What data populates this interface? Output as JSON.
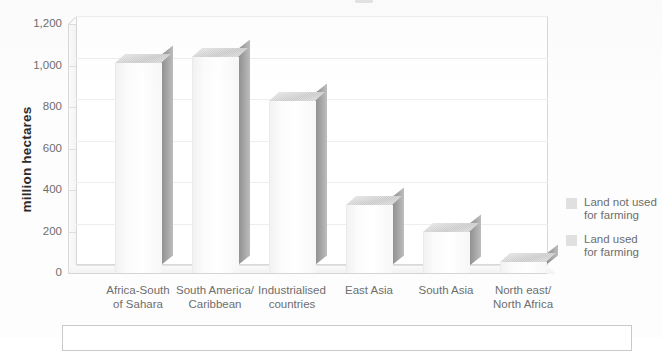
{
  "chart_data": {
    "type": "bar",
    "title": "",
    "xlabel": "",
    "ylabel": "million hectares",
    "ylim": [
      0,
      1200
    ],
    "yticks": [
      "0",
      "200",
      "400",
      "600",
      "800",
      "1,000",
      "1,200"
    ],
    "grid": true,
    "legend_position": "right",
    "categories": [
      "Africa-South\nof Sahara",
      "South America/\nCaribbean",
      "Industrialised\ncountries",
      "East Asia",
      "South Asia",
      "North east/\nNorth Africa"
    ],
    "values": [
      1010,
      1040,
      830,
      330,
      200,
      55
    ],
    "series": [
      {
        "name": "Land not used for farming",
        "values": [
          1010,
          1040,
          830,
          330,
          200,
          55
        ]
      },
      {
        "name": "Land used for farming",
        "values": [
          0,
          0,
          0,
          0,
          0,
          0
        ]
      }
    ],
    "legend": [
      "Land not used\nfor farming",
      "Land used\nfor farming"
    ],
    "colors": {
      "bar_face": "#fbfbfb",
      "bar_side": "#a2a2a2",
      "bar_top": "#d2d2d2",
      "swatch": "#e0e0e0",
      "gridline": "#eceff1",
      "axis": "#d8d8d8",
      "text": "#6e6e6e"
    }
  },
  "axis": {
    "y_label": "million hectares",
    "y_ticks": [
      {
        "label": "1,200",
        "value": 1200
      },
      {
        "label": "1,000",
        "value": 1000
      },
      {
        "label": "800",
        "value": 800
      },
      {
        "label": "600",
        "value": 600
      },
      {
        "label": "400",
        "value": 400
      },
      {
        "label": "200",
        "value": 200
      },
      {
        "label": "0",
        "value": 0
      }
    ],
    "x_categories": [
      {
        "line1": "Africa-South",
        "line2": "of Sahara"
      },
      {
        "line1": "South America/",
        "line2": "Caribbean"
      },
      {
        "line1": "Industrialised",
        "line2": "countries"
      },
      {
        "line1": "East Asia",
        "line2": ""
      },
      {
        "line1": "South Asia",
        "line2": ""
      },
      {
        "line1": "North east/",
        "line2": "North Africa"
      }
    ]
  },
  "legend": {
    "items": [
      {
        "line1": "Land not used",
        "line2": "for farming"
      },
      {
        "line1": "Land used",
        "line2": "for farming"
      }
    ]
  }
}
